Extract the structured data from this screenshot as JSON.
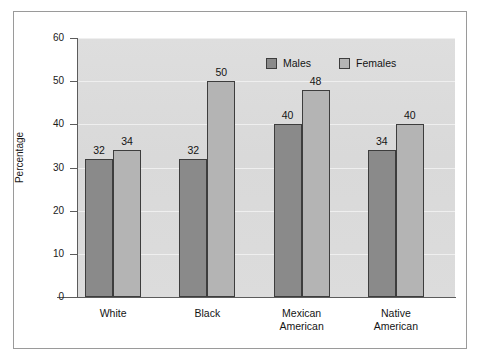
{
  "chart_data": {
    "type": "bar",
    "title": "",
    "xlabel": "",
    "ylabel": "Percentage",
    "ylim": [
      0,
      60
    ],
    "yticks": [
      0,
      10,
      20,
      30,
      40,
      50,
      60
    ],
    "ytick_labels": [
      "0",
      "10",
      "20",
      "30",
      "40",
      "50",
      "60"
    ],
    "grid": true,
    "legend_position": "top-right",
    "categories": [
      "White",
      "Black",
      "Mexican American",
      "Native American"
    ],
    "category_lines": [
      [
        "White"
      ],
      [
        "Black"
      ],
      [
        "Mexican",
        "American"
      ],
      [
        "Native",
        "American"
      ]
    ],
    "series": [
      {
        "name": "Males",
        "color": "#8a8a8a",
        "values": [
          32,
          32,
          40,
          34
        ],
        "value_labels": [
          "32",
          "32",
          "40",
          "34"
        ]
      },
      {
        "name": "Females",
        "color": "#b4b4b4",
        "values": [
          34,
          50,
          48,
          40
        ],
        "value_labels": [
          "34",
          "50",
          "48",
          "40"
        ]
      }
    ]
  },
  "legend": {
    "items": [
      {
        "label": "Males",
        "swatch": "males"
      },
      {
        "label": "Females",
        "swatch": "females"
      }
    ]
  },
  "colors": {
    "males_bar": "#8a8a8a",
    "females_bar": "#b4b4b4",
    "plot_background": "#dcdcdc",
    "gridline": "#efefef",
    "axis": "#5c5c5c",
    "frame": "#9a9a9a",
    "text": "#141414",
    "page_background": "#ffffff"
  }
}
